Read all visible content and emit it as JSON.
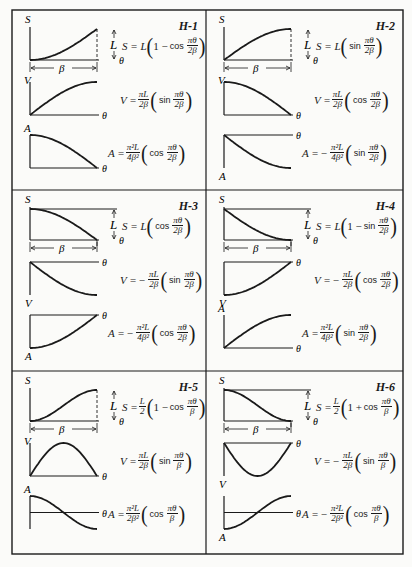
{
  "grid": {
    "rows": 3,
    "cols": 2,
    "line_color": "#1a1a1a"
  },
  "chart_data": [
    {
      "id": "H-1",
      "type": "line",
      "labels": {
        "s_axis": "S",
        "v_axis": "V",
        "a_axis": "A",
        "x_axis": "θ",
        "rise": "L",
        "period": "β"
      },
      "S": {
        "formula": "S = L (1 − cos πθ/2β)",
        "pre": "S = L",
        "lead": "1 −",
        "fn": "cos",
        "num": "πθ",
        "den": "2β"
      },
      "V": {
        "formula": "V = πL/2β (sin πθ/2β)",
        "pre": "V =",
        "coef_num": "πL",
        "coef_den": "2β",
        "sign": "",
        "fn": "sin",
        "num": "πθ",
        "den": "2β"
      },
      "A": {
        "formula": "A = π²L/4β² (cos πθ/2β)",
        "pre": "A =",
        "coef_num": "π²L",
        "coef_den": "4β²",
        "sign": "",
        "fn": "cos",
        "num": "πθ",
        "den": "2β"
      },
      "curves": {
        "S": "1-cos(x*pi/2)",
        "V": "sin(x*pi/2)",
        "A": "cos(x*pi/2)"
      },
      "v_axis_position": "bottom",
      "a_axis_position": "bottom"
    },
    {
      "id": "H-2",
      "type": "line",
      "labels": {
        "s_axis": "S",
        "v_axis": "V",
        "a_axis": "A",
        "x_axis": "θ",
        "rise": "L",
        "period": "β"
      },
      "S": {
        "formula": "S = L (sin πθ/2β)",
        "pre": "S = L",
        "lead": "",
        "fn": "sin",
        "num": "πθ",
        "den": "2β"
      },
      "V": {
        "formula": "V = πL/2β (cos πθ/2β)",
        "pre": "V =",
        "coef_num": "πL",
        "coef_den": "2β",
        "sign": "",
        "fn": "cos",
        "num": "πθ",
        "den": "2β"
      },
      "A": {
        "formula": "A = − π²L/4β² (sin πθ/2β)",
        "pre": "A =",
        "coef_num": "π²L",
        "coef_den": "4β²",
        "sign": "−",
        "fn": "sin",
        "num": "πθ",
        "den": "2β"
      },
      "curves": {
        "S": "sin(x*pi/2)",
        "V": "cos(x*pi/2)",
        "A": "-sin(x*pi/2)"
      },
      "v_axis_position": "bottom",
      "a_axis_position": "top"
    },
    {
      "id": "H-3",
      "type": "line",
      "labels": {
        "s_axis": "S",
        "v_axis": "V",
        "a_axis": "A",
        "x_axis": "θ",
        "rise": "L",
        "period": "β"
      },
      "S": {
        "formula": "S = L (cos πθ/2β)",
        "pre": "S = L",
        "lead": "",
        "fn": "cos",
        "num": "πθ",
        "den": "2β"
      },
      "V": {
        "formula": "V = − πL/2β (sin πθ/2β)",
        "pre": "V =",
        "coef_num": "πL",
        "coef_den": "2β",
        "sign": "−",
        "fn": "sin",
        "num": "πθ",
        "den": "2β"
      },
      "A": {
        "formula": "A = − π²L/4β² (cos πθ/2β)",
        "pre": "A =",
        "coef_num": "π²L",
        "coef_den": "4β²",
        "sign": "−",
        "fn": "cos",
        "num": "πθ",
        "den": "2β"
      },
      "curves": {
        "S": "cos(x*pi/2)",
        "V": "-sin(x*pi/2)",
        "A": "-cos(x*pi/2)"
      },
      "v_axis_position": "top",
      "a_axis_position": "top"
    },
    {
      "id": "H-4",
      "type": "line",
      "labels": {
        "s_axis": "S",
        "v_axis": "V",
        "a_axis": "A",
        "x_axis": "θ",
        "rise": "L",
        "period": "β"
      },
      "S": {
        "formula": "S = L (1 − sin πθ/2β)",
        "pre": "S = L",
        "lead": "1 −",
        "fn": "sin",
        "num": "πθ",
        "den": "2β"
      },
      "V": {
        "formula": "V = − πL/2β (cos πθ/2β)",
        "pre": "V =",
        "coef_num": "πL",
        "coef_den": "2β",
        "sign": "−",
        "fn": "cos",
        "num": "πθ",
        "den": "2β"
      },
      "A": {
        "formula": "A = π²L/4β² (sin πθ/2β)",
        "pre": "A =",
        "coef_num": "π²L",
        "coef_den": "4β²",
        "sign": "",
        "fn": "sin",
        "num": "πθ",
        "den": "2β"
      },
      "curves": {
        "S": "1-sin(x*pi/2)",
        "V": "-cos(x*pi/2)",
        "A": "sin(x*pi/2)"
      },
      "v_axis_position": "top",
      "a_axis_position": "bottom"
    },
    {
      "id": "H-5",
      "type": "line",
      "labels": {
        "s_axis": "S",
        "v_axis": "V",
        "a_axis": "A",
        "x_axis": "θ",
        "rise": "L",
        "period": "β"
      },
      "S": {
        "formula": "S = L/2 (1 − cos πθ/β)",
        "pre": "S =",
        "half": true,
        "lead": "1 −",
        "fn": "cos",
        "num": "πθ",
        "den": "β"
      },
      "V": {
        "formula": "V = πL/2β (sin πθ/β)",
        "pre": "V =",
        "coef_num": "πL",
        "coef_den": "2β",
        "sign": "",
        "fn": "sin",
        "num": "πθ",
        "den": "β"
      },
      "A": {
        "formula": "A = π²L/2β² (cos πθ/β)",
        "pre": "A =",
        "coef_num": "π²L",
        "coef_den": "2β²",
        "sign": "",
        "fn": "cos",
        "num": "πθ",
        "den": "β"
      },
      "curves": {
        "S": "(1-cos(x*pi))/2",
        "V": "sin(x*pi)",
        "A": "cos(x*pi)"
      },
      "v_axis_position": "bottom",
      "a_axis_position": "middle"
    },
    {
      "id": "H-6",
      "type": "line",
      "labels": {
        "s_axis": "S",
        "v_axis": "V",
        "a_axis": "A",
        "x_axis": "θ",
        "rise": "L",
        "period": "β"
      },
      "S": {
        "formula": "S = L/2 (1 + cos πθ/β)",
        "pre": "S =",
        "half": true,
        "lead": "1 +",
        "fn": "cos",
        "num": "πθ",
        "den": "β"
      },
      "V": {
        "formula": "V = − πL/2β (sin πθ/β)",
        "pre": "V =",
        "coef_num": "πL",
        "coef_den": "2β",
        "sign": "−",
        "fn": "sin",
        "num": "πθ",
        "den": "β"
      },
      "A": {
        "formula": "A = − π²L/2β² (cos πθ/β)",
        "pre": "A =",
        "coef_num": "π²L",
        "coef_den": "2β²",
        "sign": "−",
        "fn": "cos",
        "num": "πθ",
        "den": "β"
      },
      "curves": {
        "S": "(1+cos(x*pi))/2",
        "V": "-sin(x*pi)",
        "A": "-cos(x*pi)"
      },
      "v_axis_position": "top",
      "a_axis_position": "middle"
    }
  ]
}
